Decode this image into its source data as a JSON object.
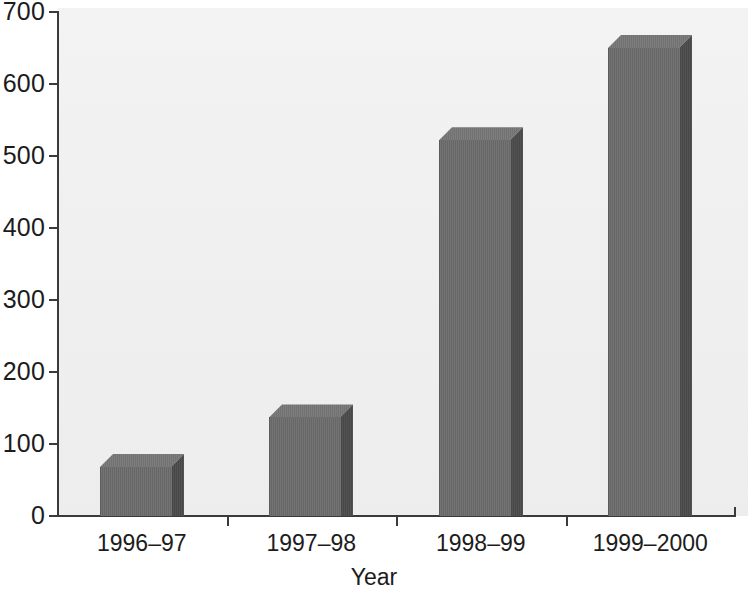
{
  "chart_data": {
    "type": "bar",
    "title": "",
    "subtitle": "",
    "categories": [
      "1996–97",
      "1997–98",
      "1998–99",
      "1999–2000"
    ],
    "values": [
      68,
      137,
      522,
      650
    ],
    "xlabel": "Year",
    "ylabel": "",
    "ylim": [
      0,
      700
    ],
    "ytick_labels": [
      "0",
      "100",
      "200",
      "300",
      "400",
      "500",
      "600",
      "700"
    ],
    "ytick_values": [
      0,
      100,
      200,
      300,
      400,
      500,
      600,
      700
    ],
    "grid": false,
    "legend": null,
    "style": "3d-bars",
    "colors": {
      "bar_front": "#6b6b6b",
      "bar_side": "#4b4b4b",
      "bar_top": "#767676",
      "axis": "#3a3a3a",
      "plot_background": "#f1f1f1",
      "text": "#1c1c1c"
    }
  }
}
